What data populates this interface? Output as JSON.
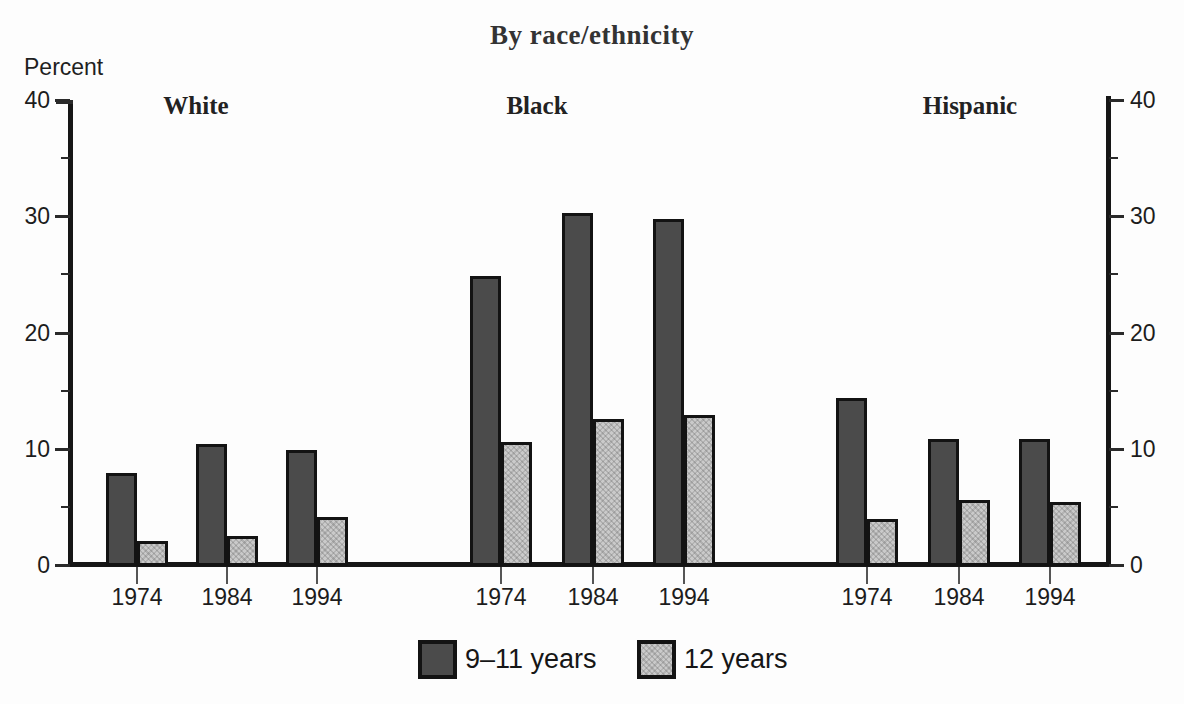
{
  "title": "By race/ethnicity",
  "y_axis": {
    "label": "Percent",
    "major_ticks": [
      0,
      10,
      20,
      30,
      40
    ],
    "minor_ticks": [
      5,
      15,
      25,
      35
    ],
    "max": 40,
    "mirrored_right_axis": true
  },
  "legend": {
    "items": [
      {
        "label": "9–11 years",
        "swatch": "dark"
      },
      {
        "label": "12 years",
        "swatch": "light"
      }
    ]
  },
  "colors": {
    "dark_bar": "#4b4b4b",
    "light_bar": "#cacaca",
    "outline": "#131313",
    "axis": "#161616"
  },
  "chart_data": {
    "type": "bar",
    "title": "By race/ethnicity",
    "xlabel": "",
    "ylabel": "Percent",
    "ylim": [
      0,
      40
    ],
    "grid": false,
    "legend_position": "bottom",
    "categories": [
      "1974",
      "1984",
      "1994"
    ],
    "groups": [
      {
        "name": "White",
        "series": [
          {
            "name": "9–11 years",
            "values": [
              7.9,
              10.4,
              9.9
            ]
          },
          {
            "name": "12 years",
            "values": [
              2.1,
              2.5,
              4.1
            ]
          }
        ]
      },
      {
        "name": "Black",
        "series": [
          {
            "name": "9–11 years",
            "values": [
              24.9,
              30.3,
              29.8
            ]
          },
          {
            "name": "12 years",
            "values": [
              10.6,
              12.6,
              12.9
            ]
          }
        ]
      },
      {
        "name": "Hispanic",
        "series": [
          {
            "name": "9–11 years",
            "values": [
              14.4,
              10.8,
              10.8
            ]
          },
          {
            "name": "12 years",
            "values": [
              4.0,
              5.6,
              5.4
            ]
          }
        ]
      }
    ]
  }
}
